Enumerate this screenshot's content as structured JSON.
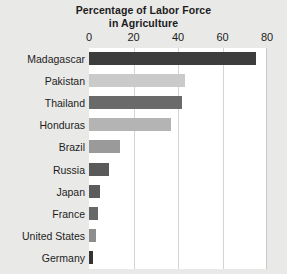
{
  "chart_data": {
    "type": "bar",
    "orientation": "horizontal",
    "title": "Percentage of Labor Force in Agriculture",
    "title_line1": "Percentage of Labor Force",
    "title_line2": "in Agriculture",
    "xlabel": "",
    "ylabel": "",
    "xlim": [
      0,
      80
    ],
    "xticks": [
      0,
      20,
      40,
      60,
      80
    ],
    "xtick_labels": [
      "0",
      "20",
      "40",
      "60",
      "80"
    ],
    "grid": "vertical",
    "legend": "none",
    "categories": [
      "Madagascar",
      "Pakistan",
      "Thailand",
      "Honduras",
      "Brazil",
      "Russia",
      "Japan",
      "France",
      "United States",
      "Germany"
    ],
    "values": [
      75,
      43,
      42,
      37,
      14,
      9,
      5,
      4,
      3,
      2
    ],
    "bar_colors": [
      "#3d3d3d",
      "#cacaca",
      "#6a6a6a",
      "#b4b4b4",
      "#9a9a9a",
      "#5a5a5a",
      "#5c5c5c",
      "#686868",
      "#8d8d8d",
      "#333333"
    ]
  },
  "style": {
    "page_background": "#e9e9e7",
    "plot_background": "#ffffff",
    "gridline_color": "#d4d4d4",
    "text_color": "#1d1d1d"
  }
}
